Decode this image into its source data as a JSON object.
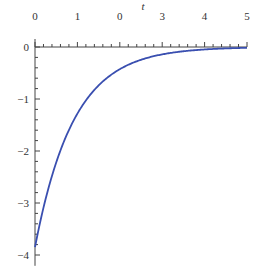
{
  "chart_data": {
    "type": "line",
    "title": "",
    "xlabel": "t",
    "ylabel": "",
    "xlim": [
      0,
      5
    ],
    "ylim": [
      -4.15,
      0
    ],
    "x_ticks": [
      0,
      1,
      2,
      3,
      4,
      5
    ],
    "x_tick_labels": [
      "0",
      "1",
      "0",
      "3",
      "4",
      "5"
    ],
    "y_ticks": [
      0,
      -1,
      -2,
      -3,
      -4
    ],
    "y_tick_labels": [
      "0",
      "−1",
      "−2",
      "−3",
      "−4"
    ],
    "x_minor_step": 0.2,
    "y_minor_step": 0.2,
    "grid": false,
    "legend": null,
    "axes_position": "x-axis at top (y=0), y-axis at left (t=0)",
    "series": [
      {
        "name": "curve",
        "color": "#3a4fb0",
        "x": [
          0,
          0.25,
          0.5,
          0.75,
          1.0,
          1.25,
          1.5,
          1.75,
          2.0,
          2.5,
          3.0,
          3.5,
          4.0,
          4.5,
          5.0
        ],
        "values": [
          -3.85,
          -2.9,
          -2.22,
          -1.7,
          -1.28,
          -0.97,
          -0.74,
          -0.56,
          -0.43,
          -0.25,
          -0.14,
          -0.08,
          -0.05,
          -0.03,
          -0.02
        ]
      }
    ]
  },
  "layout": {
    "x0_px": 35,
    "x5_px": 247,
    "y0_px": 47,
    "yunit_px": 52
  }
}
